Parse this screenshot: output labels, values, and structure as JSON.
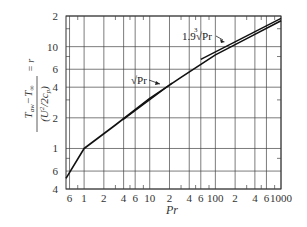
{
  "chart_data": {
    "type": "line",
    "title": "",
    "xlabel": "Pr",
    "ylabel": "(T_aw − T_∞) / (U_∞² / 2c_p) = r",
    "xscale": "log",
    "yscale": "log",
    "xlim": [
      0.53,
      1000
    ],
    "ylim": [
      0.4,
      20
    ],
    "grid": true,
    "x_ticks": [
      {
        "value": 0.6,
        "label": "6"
      },
      {
        "value": 1,
        "label": "1"
      },
      {
        "value": 2,
        "label": "2"
      },
      {
        "value": 4,
        "label": "4"
      },
      {
        "value": 6,
        "label": "6"
      },
      {
        "value": 10,
        "label": "10"
      },
      {
        "value": 20,
        "label": "2"
      },
      {
        "value": 40,
        "label": "4"
      },
      {
        "value": 60,
        "label": "6"
      },
      {
        "value": 100,
        "label": "100"
      },
      {
        "value": 200,
        "label": "2"
      },
      {
        "value": 400,
        "label": "4"
      },
      {
        "value": 600,
        "label": "6"
      },
      {
        "value": 1000,
        "label": "1000"
      }
    ],
    "y_ticks": [
      {
        "value": 0.4,
        "label": "4"
      },
      {
        "value": 0.6,
        "label": "6"
      },
      {
        "value": 1,
        "label": "1"
      },
      {
        "value": 2,
        "label": "2"
      },
      {
        "value": 4,
        "label": "4"
      },
      {
        "value": 6,
        "label": "6"
      },
      {
        "value": 10,
        "label": "10"
      },
      {
        "value": 20,
        "label": "2"
      }
    ],
    "series": [
      {
        "name": "recovery factor r",
        "x": [
          0.53,
          1,
          3,
          10,
          30,
          100,
          300,
          1000
        ],
        "y": [
          0.51,
          1.0,
          1.7,
          3.1,
          5.0,
          8.3,
          12.0,
          18.0
        ]
      },
      {
        "name": "√Pr",
        "x": [
          3.9,
          22
        ],
        "y": [
          1.92,
          4.4
        ]
      },
      {
        "name": "1.9 ∛Pr",
        "x": [
          60,
          1000
        ],
        "y": [
          7.5,
          19.0
        ]
      }
    ],
    "annotations": [
      {
        "text": "√Pr",
        "points_to": "√Pr line"
      },
      {
        "text": "1.9∛Pr",
        "points_to": "1.9∛Pr line"
      }
    ]
  },
  "labels": {
    "xlabel": "Pr",
    "annotation_sqrt": "√Pr",
    "annotation_cbrt_coef": "1.9",
    "annotation_cbrt_index": "3",
    "annotation_cbrt_body": "√Pr",
    "ylabel_num": "T",
    "ylabel_num_sub1": "aw",
    "ylabel_num_mid": "−T",
    "ylabel_num_sub2": "∞",
    "ylabel_den": "(U",
    "ylabel_den_sub": "∞",
    "ylabel_den_sup": "2",
    "ylabel_den_end": "/2c",
    "ylabel_den_sub2": "p",
    "ylabel_den_close": ")",
    "ylabel_eq": "= r"
  }
}
